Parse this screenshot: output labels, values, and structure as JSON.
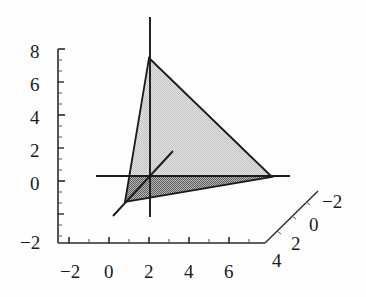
{
  "figure": {
    "kind": "3d-plot",
    "background": "#fefefe",
    "line_color": "#1a1a1a",
    "fill_light": "#cdcdcd",
    "fill_dark": "#8f8f8f",
    "edge_color": "#1a1a1a"
  },
  "chart_data": {
    "type": "scatter",
    "title": "",
    "xlabel": "",
    "ylabel": "",
    "zlabel": "",
    "grid": false,
    "legend": null,
    "projection": "3d",
    "xlim": [
      -2,
      7
    ],
    "ylim": [
      -2,
      4
    ],
    "zlim": [
      -2,
      8
    ],
    "x_ticks": [
      "-2",
      "0",
      "2",
      "4",
      "6"
    ],
    "x_tick_values": [
      -2,
      0,
      2,
      4,
      6
    ],
    "y_ticks": [
      "4",
      "2",
      "0",
      "-2"
    ],
    "y_tick_values": [
      4,
      2,
      0,
      -2
    ],
    "z_ticks": [
      "-2",
      "0",
      "2",
      "4",
      "6",
      "8"
    ],
    "z_tick_values": [
      -2,
      0,
      2,
      4,
      6,
      8
    ],
    "annotations": [
      "shaded triangular plane region",
      "three coordinate axis lines through origin"
    ],
    "series": [
      {
        "name": "triangular-plane",
        "vertices_screen": [
          [
            149,
            58
          ],
          [
            272,
            177
          ],
          [
            125,
            202
          ]
        ],
        "fill_upper": "#cdcdcd",
        "fill_lower": "#8f8f8f"
      }
    ],
    "axis_lines_screen": [
      {
        "name": "x-axis-line",
        "from": [
          96,
          176
        ],
        "to": [
          290,
          176
        ]
      },
      {
        "name": "z-axis-line",
        "from": [
          150,
          17
        ],
        "to": [
          150,
          217
        ]
      },
      {
        "name": "y-axis-line",
        "from": [
          113,
          216
        ],
        "to": [
          173,
          151
        ]
      }
    ]
  },
  "z_axis": {
    "name": "vertical-axis",
    "labels": [
      {
        "text": "8",
        "x": 30,
        "y": 42
      },
      {
        "text": "6",
        "x": 30,
        "y": 75
      },
      {
        "text": "4",
        "x": 30,
        "y": 108
      },
      {
        "text": "2",
        "x": 30,
        "y": 141
      },
      {
        "text": "0",
        "x": 30,
        "y": 174
      },
      {
        "text": "-2",
        "x": 20,
        "y": 233
      }
    ]
  },
  "x_axis": {
    "name": "horizontal-axis",
    "labels": [
      {
        "text": "-2",
        "x": 60,
        "y": 262
      },
      {
        "text": "0",
        "x": 104,
        "y": 262
      },
      {
        "text": "2",
        "x": 144,
        "y": 262
      },
      {
        "text": "4",
        "x": 184,
        "y": 262
      },
      {
        "text": "6",
        "x": 224,
        "y": 262
      }
    ]
  },
  "y_axis": {
    "name": "depth-axis",
    "labels": [
      {
        "text": "4",
        "x": 272,
        "y": 251
      },
      {
        "text": "2",
        "x": 291,
        "y": 234
      },
      {
        "text": "0",
        "x": 309,
        "y": 215
      },
      {
        "text": "-2",
        "x": 322,
        "y": 192
      }
    ]
  }
}
